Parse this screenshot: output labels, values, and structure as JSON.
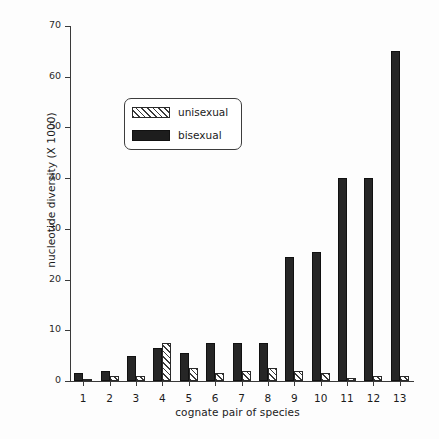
{
  "chart_data": {
    "type": "bar",
    "title": "",
    "xlabel": "cognate pair of species",
    "ylabel": "nucleotide diversity (X 1000)",
    "categories": [
      "1",
      "2",
      "3",
      "4",
      "5",
      "6",
      "7",
      "8",
      "9",
      "10",
      "11",
      "12",
      "13"
    ],
    "series": [
      {
        "name": "unisexual",
        "fill": "hatched",
        "values": [
          0.3,
          1.0,
          1.0,
          7.5,
          2.5,
          1.5,
          2.0,
          2.5,
          2.0,
          1.5,
          0.5,
          1.0,
          1.0
        ]
      },
      {
        "name": "bisexual",
        "fill": "solid-black",
        "values": [
          1.5,
          2.0,
          5.0,
          6.5,
          5.5,
          7.5,
          7.5,
          7.5,
          24.5,
          25.5,
          40.0,
          40.0,
          65.0
        ]
      }
    ],
    "ylim": [
      0,
      70
    ],
    "yticks": [
      0,
      10,
      20,
      30,
      40,
      50,
      60,
      70
    ],
    "ytick_labels": [
      "0",
      "10",
      "20",
      "30",
      "40",
      "50",
      "60",
      "70"
    ],
    "grid": false,
    "legend_position": "upper-left-inset"
  },
  "legend": {
    "items": [
      {
        "label": "unisexual",
        "swatch": "hatched-swatch"
      },
      {
        "label": "bisexual",
        "swatch": "solid-black-swatch"
      }
    ]
  },
  "colors": {
    "bisexual": "#262626",
    "unisexual_line": "#3a3a3a",
    "axis": "#3a3a3a",
    "text": "#1b1b1b",
    "background": "#fdfdfd"
  }
}
